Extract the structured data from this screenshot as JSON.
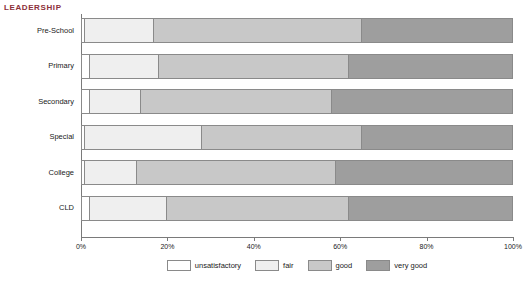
{
  "title": "LEADERSHIP",
  "chart_data": {
    "type": "bar",
    "orientation": "horizontal",
    "stacked": true,
    "normalized": true,
    "title": "LEADERSHIP",
    "xlabel": "",
    "ylabel": "",
    "xlim": [
      0,
      100
    ],
    "grid": false,
    "legend_position": "bottom",
    "categories": [
      "Pre-School",
      "Primary",
      "Secondary",
      "Special",
      "College",
      "CLD"
    ],
    "tick_labels": [
      "0%",
      "20%",
      "40%",
      "60%",
      "80%",
      "100%"
    ],
    "tick_values": [
      0,
      20,
      40,
      60,
      80,
      100
    ],
    "series": [
      {
        "name": "unsatisfactory",
        "color": "#ffffff",
        "values": [
          1,
          2,
          2,
          1,
          1,
          2
        ]
      },
      {
        "name": "fair",
        "color": "#efefef",
        "values": [
          16,
          16,
          12,
          27,
          12,
          18
        ]
      },
      {
        "name": "good",
        "color": "#c8c8c8",
        "values": [
          48,
          44,
          44,
          37,
          46,
          42
        ]
      },
      {
        "name": "very good",
        "color": "#9e9e9e",
        "values": [
          35,
          38,
          42,
          35,
          41,
          38
        ]
      }
    ]
  },
  "colors": {
    "title": "#8c2f39",
    "axis": "#7a7a7a",
    "segment_border": "#8a8a8a",
    "unsatisfactory": "#ffffff",
    "fair": "#efefef",
    "good": "#c8c8c8",
    "very_good": "#9e9e9e"
  }
}
